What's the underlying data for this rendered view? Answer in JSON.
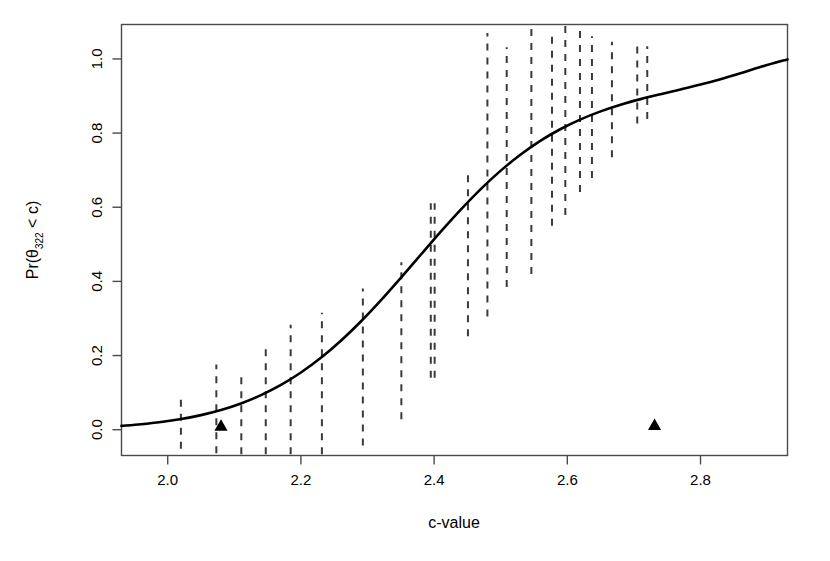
{
  "chart_data": {
    "type": "line",
    "title": "",
    "xlabel": "c-value",
    "ylabel_prefix": "Pr(θ",
    "ylabel_sub": "322",
    "ylabel_suffix": " < c)",
    "ylabel_full": "Pr(θ322 < c)",
    "xlim": [
      1.9306,
      2.9306
    ],
    "ylim": [
      -0.0696,
      1.0929
    ],
    "xticks": [
      2.0,
      2.2,
      2.4,
      2.6,
      2.8
    ],
    "xticklabels": [
      "2.0",
      "2.2",
      "2.4",
      "2.6",
      "2.8"
    ],
    "yticks": [
      0.0,
      0.2,
      0.4,
      0.6,
      0.8,
      1.0
    ],
    "yticklabels": [
      "0.0",
      "0.2",
      "0.4",
      "0.6",
      "0.8",
      "1.0"
    ],
    "grid": false,
    "legend": null,
    "line_color": "#000000",
    "line_width": 2.6,
    "errorbar_color": "#3a3a3a",
    "errorbar_style": "dashed",
    "marker_color": "#000000",
    "curve": {
      "name": "Posterior CDF",
      "x": [
        1.9306,
        1.96,
        1.99,
        2.02,
        2.05,
        2.08,
        2.11,
        2.14,
        2.17,
        2.2,
        2.23,
        2.26,
        2.29,
        2.32,
        2.35,
        2.38,
        2.41,
        2.44,
        2.47,
        2.5,
        2.53,
        2.56,
        2.59,
        2.62,
        2.65,
        2.68,
        2.71,
        2.74,
        2.77,
        2.8,
        2.83,
        2.86,
        2.89,
        2.9306
      ],
      "y": [
        0.0103,
        0.0147,
        0.0207,
        0.0287,
        0.0393,
        0.0531,
        0.0708,
        0.0932,
        0.1208,
        0.1543,
        0.194,
        0.24,
        0.2919,
        0.3489,
        0.4095,
        0.4719,
        0.534,
        0.5936,
        0.649,
        0.6988,
        0.7424,
        0.7797,
        0.811,
        0.8371,
        0.8586,
        0.8765,
        0.8916,
        0.9049,
        0.9176,
        0.9308,
        0.9453,
        0.9613,
        0.9783,
        0.9988
      ]
    },
    "errorbars": [
      {
        "x": 2.0198,
        "low": -0.0516,
        "high": 0.0978
      },
      {
        "x": 2.073,
        "low": -0.0634,
        "high": 0.1758
      },
      {
        "x": 2.1105,
        "low": -0.0664,
        "high": 0.1463
      },
      {
        "x": 2.1472,
        "low": -0.0664,
        "high": 0.2183
      },
      {
        "x": 2.1846,
        "low": -0.0664,
        "high": 0.2832
      },
      {
        "x": 2.2315,
        "low": -0.0664,
        "high": 0.3157
      },
      {
        "x": 2.293,
        "low": -0.0428,
        "high": 0.3805
      },
      {
        "x": 2.3508,
        "low": 0.028,
        "high": 0.4513
      },
      {
        "x": 2.4008,
        "low": 0.14,
        "high": 0.6106
      },
      {
        "x": 2.4508,
        "low": 0.252,
        "high": 0.705
      },
      {
        "x": 2.509,
        "low": 0.3847,
        "high": 1.0315
      },
      {
        "x": 2.546,
        "low": 0.42,
        "high": 1.0906
      },
      {
        "x": 2.577,
        "low": 0.55,
        "high": 1.07
      },
      {
        "x": 2.597,
        "low": 0.579,
        "high": 1.0906
      },
      {
        "x": 2.619,
        "low": 0.641,
        "high": 1.0906
      },
      {
        "x": 2.637,
        "low": 0.679,
        "high": 1.0611
      },
      {
        "x": 2.667,
        "low": 0.735,
        "high": 1.0463
      },
      {
        "x": 2.705,
        "low": 0.826,
        "high": 1.0404
      },
      {
        "x": 2.72,
        "low": 0.838,
        "high": 1.0345
      },
      {
        "x": 2.395,
        "low": 0.14,
        "high": 0.6106
      },
      {
        "x": 2.48,
        "low": 0.305,
        "high": 1.0699
      }
    ],
    "markers": [
      {
        "shape": "triangle-up",
        "x": 2.08,
        "y": 0.01,
        "size": 11
      },
      {
        "shape": "triangle-up",
        "x": 2.731,
        "y": 0.012,
        "size": 11
      }
    ]
  }
}
